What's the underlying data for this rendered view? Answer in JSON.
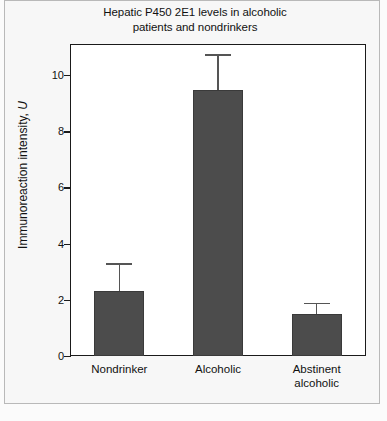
{
  "chart_data": {
    "type": "bar",
    "title": "Hepatic P450 2E1 levels in alcoholic patients and nondrinkers",
    "title_line1": "Hepatic P450 2E1 levels in alcoholic",
    "title_line2": "patients and nondrinkers",
    "xlabel": "",
    "ylabel": "Immunoreaction intensity, U",
    "ylabel_text": "Immunoreaction intensity, ",
    "ylabel_unit": "U",
    "categories": [
      "Nondrinker",
      "Alcoholic",
      "Abstinent alcoholic"
    ],
    "category_lines": [
      [
        "Nondrinker"
      ],
      [
        "Alcoholic"
      ],
      [
        "Abstinent",
        "alcoholic"
      ]
    ],
    "values": [
      2.3,
      9.45,
      1.5
    ],
    "errors_upper": [
      1.0,
      1.3,
      0.4
    ],
    "error_tops": [
      3.3,
      10.75,
      1.9
    ],
    "ylim": [
      0,
      11.1
    ],
    "yticks": [
      0,
      2,
      4,
      6,
      8,
      10
    ],
    "ytick_labels": [
      "0",
      "2",
      "4",
      "6",
      "8",
      "10"
    ],
    "grid": false,
    "legend": false,
    "bar_color": "#4c4c4c",
    "error_color": "#555555",
    "axis_color": "#1a1a1a",
    "background": "#ffffff",
    "figure_background": "#f7f7f7"
  }
}
